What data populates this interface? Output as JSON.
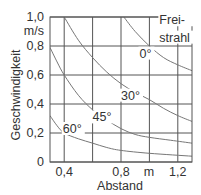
{
  "chart_data": {
    "type": "line",
    "title": "",
    "xlabel": "Abstand",
    "x_unit": "m",
    "ylabel": "Geschwindigkeit",
    "y_unit": "m/s",
    "xlim": [
      0.3,
      1.3
    ],
    "ylim": [
      0,
      1.0
    ],
    "x_ticks": [
      {
        "value": 0.4,
        "label": "0,4"
      },
      {
        "value": 0.8,
        "label": "0,8"
      },
      {
        "value": 1.2,
        "label": "1,2"
      }
    ],
    "x_unit_tick": {
      "value": 1.0,
      "label": "m"
    },
    "x_gridlines": [
      0.4,
      0.6,
      0.8,
      1.0,
      1.2
    ],
    "y_ticks": [
      {
        "value": 0,
        "label": "0"
      },
      {
        "value": 0.2,
        "label": "0,2"
      },
      {
        "value": 0.4,
        "label": "0,4"
      },
      {
        "value": 0.6,
        "label": "0,6"
      },
      {
        "value": 0.8,
        "label": "0,8"
      },
      {
        "value": 1.0,
        "label": "1,0"
      }
    ],
    "y_unit_label": "m/s",
    "grid": true,
    "legend": null,
    "series": [
      {
        "name": "0° (Freistrahl)",
        "label": "0°",
        "points": [
          [
            0.82,
            1.0
          ],
          [
            0.9,
            0.9
          ],
          [
            1.0,
            0.8
          ],
          [
            1.1,
            0.72
          ],
          [
            1.2,
            0.67
          ],
          [
            1.3,
            0.63
          ]
        ]
      },
      {
        "name": "30°",
        "label": "30°",
        "points": [
          [
            0.4,
            1.0
          ],
          [
            0.5,
            0.84
          ],
          [
            0.6,
            0.72
          ],
          [
            0.7,
            0.62
          ],
          [
            0.8,
            0.54
          ],
          [
            0.9,
            0.48
          ],
          [
            1.0,
            0.43
          ],
          [
            1.1,
            0.37
          ],
          [
            1.2,
            0.32
          ],
          [
            1.3,
            0.28
          ]
        ]
      },
      {
        "name": "45°",
        "label": "45°",
        "points": [
          [
            0.3,
            0.79
          ],
          [
            0.35,
            0.69
          ],
          [
            0.4,
            0.6
          ],
          [
            0.5,
            0.46
          ],
          [
            0.6,
            0.36
          ],
          [
            0.7,
            0.29
          ],
          [
            0.8,
            0.23
          ],
          [
            0.9,
            0.19
          ],
          [
            1.0,
            0.17
          ],
          [
            1.15,
            0.15
          ],
          [
            1.3,
            0.13
          ]
        ]
      },
      {
        "name": "60°",
        "label": "60°",
        "points": [
          [
            0.3,
            0.32
          ],
          [
            0.35,
            0.25
          ],
          [
            0.4,
            0.2
          ],
          [
            0.5,
            0.16
          ],
          [
            0.6,
            0.13
          ],
          [
            0.7,
            0.1
          ],
          [
            0.8,
            0.08
          ],
          [
            1.0,
            0.06
          ],
          [
            1.3,
            0.04
          ]
        ]
      }
    ],
    "annotations": [
      {
        "text": "Frei-",
        "x": 1.07,
        "y": 0.95
      },
      {
        "text": "strahl",
        "x": 1.07,
        "y": 0.83
      },
      {
        "text": "0°",
        "x": 0.93,
        "y": 0.72
      },
      {
        "text": "30°",
        "x": 0.8,
        "y": 0.43
      },
      {
        "text": "45°",
        "x": 0.6,
        "y": 0.28
      },
      {
        "text": "60°",
        "x": 0.39,
        "y": 0.2
      }
    ]
  },
  "style": {
    "frame_color": "#555555",
    "grid_color": "#555555",
    "curve_color": "#777777",
    "text_color": "#333333"
  }
}
